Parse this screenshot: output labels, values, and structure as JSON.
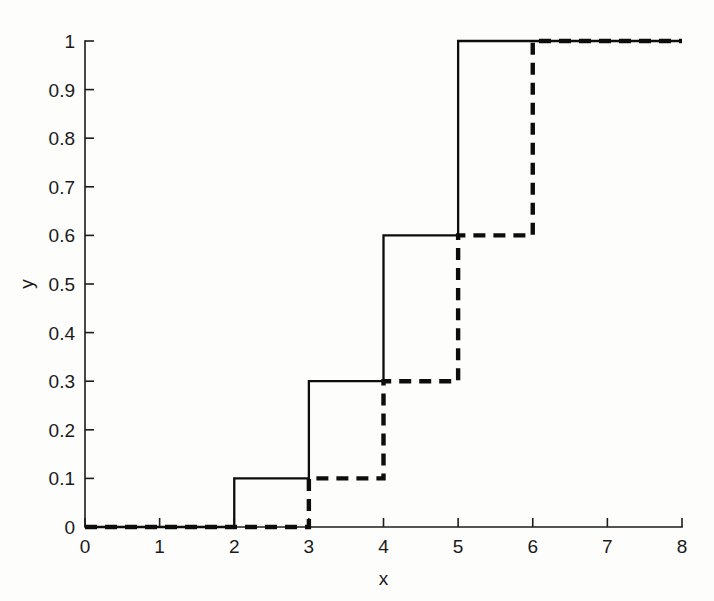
{
  "figure": {
    "background_color": "#fdfdfc",
    "line_color": "#0d0d0d",
    "axis_color": "#1c1c1c"
  },
  "chart_data": {
    "type": "line",
    "title": "",
    "subtitle": "",
    "xlabel": "x",
    "ylabel": "y",
    "xlim": [
      0,
      8
    ],
    "ylim": [
      0,
      1
    ],
    "xticks": [
      "0",
      "1",
      "2",
      "3",
      "4",
      "5",
      "6",
      "7",
      "8"
    ],
    "xtick_values": [
      0,
      1,
      2,
      3,
      4,
      5,
      6,
      7,
      8
    ],
    "yticks": [
      "0",
      "0.1",
      "0.2",
      "0.3",
      "0.4",
      "0.5",
      "0.6",
      "0.7",
      "0.8",
      "0.9",
      "1"
    ],
    "ytick_values": [
      0,
      0.1,
      0.2,
      0.3,
      0.4,
      0.5,
      0.6,
      0.7,
      0.8,
      0.9,
      1
    ],
    "grid": false,
    "legend": false,
    "legend_position": "none",
    "annotations": [],
    "series": [
      {
        "name": "solid step function",
        "style": "solid",
        "drawstyle": "steps-post",
        "x": [
          0,
          2,
          3,
          4,
          5,
          8
        ],
        "values": [
          0,
          0.1,
          0.3,
          0.6,
          1.0,
          1.0
        ],
        "steps": [
          {
            "from_x": 0,
            "to_x": 2,
            "y": 0.0
          },
          {
            "from_x": 2,
            "to_x": 3,
            "y": 0.1
          },
          {
            "from_x": 3,
            "to_x": 4,
            "y": 0.3
          },
          {
            "from_x": 4,
            "to_x": 5,
            "y": 0.6
          },
          {
            "from_x": 5,
            "to_x": 8,
            "y": 1.0
          }
        ]
      },
      {
        "name": "dashed step function",
        "style": "dashed",
        "drawstyle": "steps-post",
        "x": [
          0,
          3,
          4,
          5,
          6,
          8
        ],
        "values": [
          0,
          0.1,
          0.3,
          0.6,
          1.0,
          1.0
        ],
        "steps": [
          {
            "from_x": 0,
            "to_x": 3,
            "y": 0.0
          },
          {
            "from_x": 3,
            "to_x": 4,
            "y": 0.1
          },
          {
            "from_x": 4,
            "to_x": 5,
            "y": 0.3
          },
          {
            "from_x": 5,
            "to_x": 6,
            "y": 0.6
          },
          {
            "from_x": 6,
            "to_x": 8,
            "y": 1.0
          }
        ]
      }
    ]
  }
}
